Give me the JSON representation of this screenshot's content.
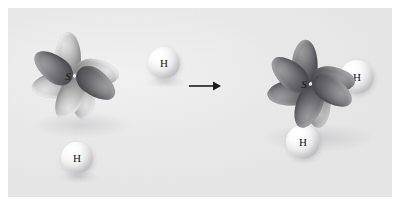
{
  "figure": {
    "background_color": "#ececed",
    "panel_color": "#ececed",
    "lobe_light_color": "#cfcfcf",
    "lobe_dark_color": "#87878a",
    "hydrogen_color": "#ececec",
    "arrow_color": "#1c1c1c"
  },
  "reactants": {
    "label": "reactants",
    "sulfur": {
      "symbol": "S",
      "name": "sulfur-atom",
      "center": [
        68,
        76
      ]
    },
    "hydrogens": [
      {
        "symbol": "H",
        "name": "hydrogen-atom-upper",
        "center": [
          164,
          63
        ]
      },
      {
        "symbol": "H",
        "name": "hydrogen-atom-lower",
        "center": [
          77,
          158
        ]
      }
    ],
    "orbital_lobes": [
      {
        "name": "lobe-up",
        "angle": 0,
        "shade": "light"
      },
      {
        "name": "lobe-up-left",
        "angle": -52,
        "shade": "dark"
      },
      {
        "name": "lobe-left",
        "angle": -98,
        "shade": "light"
      },
      {
        "name": "lobe-down-left",
        "angle": 198,
        "shade": "light"
      },
      {
        "name": "lobe-down",
        "angle": 176,
        "shade": "light"
      },
      {
        "name": "lobe-down-right",
        "angle": 126,
        "shade": "dark"
      },
      {
        "name": "lobe-right",
        "angle": 98,
        "shade": "light"
      }
    ]
  },
  "arrow": {
    "name": "reaction-arrow",
    "direction": "right",
    "glyph": "→"
  },
  "products": {
    "label": "products",
    "sulfur": {
      "symbol": "S",
      "name": "sulfur-atom",
      "center": [
        304,
        84
      ]
    },
    "hydrogens": [
      {
        "symbol": "H",
        "name": "hydrogen-atom-bonded-right",
        "center": [
          357,
          77
        ]
      },
      {
        "symbol": "H",
        "name": "hydrogen-atom-bonded-bottom",
        "center": [
          303,
          142
        ]
      }
    ],
    "orbital_lobes": [
      {
        "name": "lobe-up",
        "angle": 2,
        "shade": "dark"
      },
      {
        "name": "lobe-up-left",
        "angle": -48,
        "shade": "dark"
      },
      {
        "name": "lobe-left",
        "angle": -96,
        "shade": "dark"
      },
      {
        "name": "lobe-down-left",
        "angle": 202,
        "shade": "dark"
      },
      {
        "name": "lobe-down",
        "angle": 178,
        "shade": "mid"
      },
      {
        "name": "lobe-down-right",
        "angle": 124,
        "shade": "dark"
      },
      {
        "name": "lobe-right",
        "angle": 96,
        "shade": "dark"
      }
    ]
  }
}
